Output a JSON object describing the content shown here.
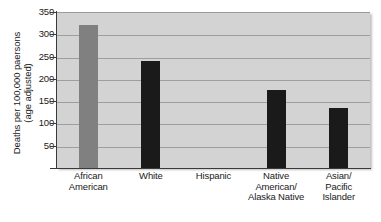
{
  "chart_data": {
    "type": "bar",
    "title": "",
    "xlabel": "",
    "ylabel": "Deaths per 100,000 paersons (age adjusted)",
    "ylabel_lines": [
      "Deaths per 100,000 paersons",
      "(age adjusted)"
    ],
    "ylim": [
      0,
      350
    ],
    "ytick_values": [
      350,
      300,
      250,
      200,
      150,
      100,
      50
    ],
    "ytick_labels": [
      "350",
      "300",
      "250",
      "200",
      "150",
      "100",
      "50"
    ],
    "grid": true,
    "legend": "none",
    "categories": [
      "African American",
      "White",
      "Hispanic",
      "Native American/ Alaska Native",
      "Asian/ Pacific Islander"
    ],
    "category_lines": [
      [
        "African",
        "American"
      ],
      [
        "White"
      ],
      [
        "Hispanic"
      ],
      [
        "Native",
        "American/",
        "Alaska Native"
      ],
      [
        "Asian/",
        "Pacific",
        "Islander"
      ]
    ],
    "values": [
      322,
      243,
      null,
      178,
      138
    ],
    "bar_colors": [
      "#808080",
      "#1a1a1a",
      "none",
      "#1a1a1a",
      "#1a1a1a"
    ]
  },
  "style": {
    "plot_background": "#d3d3d3",
    "gridline_color": "#9e9e9e",
    "axis_color": "#3a3a3a",
    "page_background": "#ffffff",
    "bar_gray": "#808080",
    "bar_black": "#1a1a1a"
  }
}
